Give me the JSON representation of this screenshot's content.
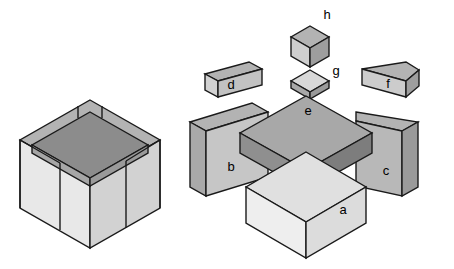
{
  "figure": {
    "background_color": "#ffffff",
    "stroke_color": "#1a1a1a",
    "stroke_width": 1.4,
    "palette": {
      "top_face": "#b3b3b3",
      "left_face": "#e8e8e8",
      "right_face": "#c9c9c9",
      "dark_top": "#8c8c8c",
      "dark_left": "#a6a6a6",
      "dark_right": "#9a9a9a",
      "light_top": "#d8d8d8"
    },
    "assembled": {
      "name": "assembled-cube",
      "description": "Completed cube formed by joining all eight parts",
      "center_x": 90,
      "center_y": 175
    },
    "exploded": {
      "name": "exploded-assembly",
      "description": "Eight separated parts shown in isometric projection"
    }
  },
  "parts": [
    {
      "id": "a",
      "label": "a",
      "name": "part-a-base-cube",
      "shape": "cube",
      "label_x": 343,
      "label_y": 211
    },
    {
      "id": "b",
      "label": "b",
      "name": "part-b-left-panel",
      "shape": "panel",
      "label_x": 231,
      "label_y": 168
    },
    {
      "id": "c",
      "label": "c",
      "name": "part-c-right-panel",
      "shape": "panel",
      "label_x": 386,
      "label_y": 172
    },
    {
      "id": "d",
      "label": "d",
      "name": "part-d-left-bar",
      "shape": "bar",
      "label_x": 231,
      "label_y": 86
    },
    {
      "id": "e",
      "label": "e",
      "name": "part-e-top-slab",
      "shape": "slab",
      "label_x": 308,
      "label_y": 112
    },
    {
      "id": "f",
      "label": "f",
      "name": "part-f-right-bar",
      "shape": "bar",
      "label_x": 388,
      "label_y": 85
    },
    {
      "id": "g",
      "label": "g",
      "name": "part-g-socket",
      "shape": "socket",
      "label_x": 336,
      "label_y": 72
    },
    {
      "id": "h",
      "label": "h",
      "name": "part-h-small-cube",
      "shape": "small-cube",
      "label_x": 327,
      "label_y": 16
    }
  ]
}
